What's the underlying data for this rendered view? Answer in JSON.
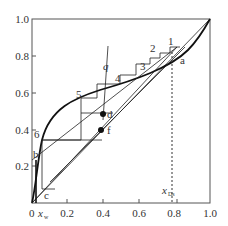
{
  "diagram": {
    "type": "McCabe-Thiele stepping diagram",
    "x_axis": {
      "ticks": [
        "0",
        "0.2",
        "0.4",
        "0.6",
        "0.8",
        "1.0"
      ],
      "min": 0,
      "max": 1.0,
      "first_label_suffix": "x_w"
    },
    "y_axis": {
      "ticks": [
        "0.2",
        "0.4",
        "0.6",
        "0.8",
        "1.0"
      ],
      "min": 0,
      "max": 1.0
    },
    "labels": {
      "q": "q",
      "a": "a",
      "b": "b",
      "c": "c",
      "d": "d",
      "f": "f",
      "xw": "x",
      "xw_sub": "w",
      "xD": "x",
      "xD_sub": "Ds"
    },
    "stages": [
      "1",
      "2",
      "3",
      "4",
      "5",
      "6"
    ],
    "colors": {
      "ink": "#1a1a1a",
      "axis": "#555555",
      "text": "#333333"
    }
  }
}
